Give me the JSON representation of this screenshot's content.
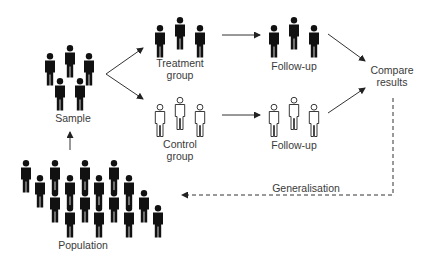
{
  "diagram": {
    "type": "study-design-flow",
    "nodes": {
      "sample": {
        "label": "Sample",
        "figure_count": 5,
        "figure_style": "filled"
      },
      "treatment": {
        "label_line1": "Treatment",
        "label_line2": "group",
        "figure_count": 3,
        "figure_style": "filled"
      },
      "control": {
        "label_line1": "Control",
        "label_line2": "group",
        "figure_count": 3,
        "figure_style": "outline"
      },
      "followup_treatment": {
        "label": "Follow-up",
        "figure_count": 3,
        "figure_style": "filled"
      },
      "followup_control": {
        "label": "Follow-up",
        "figure_count": 3,
        "figure_style": "outline"
      },
      "compare": {
        "label_line1": "Compare",
        "label_line2": "results"
      },
      "population": {
        "label": "Population",
        "figure_count": 20,
        "figure_style": "filled"
      }
    },
    "edges": [
      {
        "from": "population",
        "to": "sample",
        "style": "solid"
      },
      {
        "from": "sample",
        "to": "treatment",
        "style": "solid"
      },
      {
        "from": "sample",
        "to": "control",
        "style": "solid"
      },
      {
        "from": "treatment",
        "to": "followup_treatment",
        "style": "solid"
      },
      {
        "from": "control",
        "to": "followup_control",
        "style": "solid"
      },
      {
        "from": "followup_treatment",
        "to": "compare",
        "style": "solid"
      },
      {
        "from": "followup_control",
        "to": "compare",
        "style": "solid"
      },
      {
        "from": "compare",
        "to": "population",
        "style": "dashed",
        "label": "Generalisation"
      }
    ],
    "generalisation_label": "Generalisation"
  },
  "colors": {
    "figure_fill": "#111111",
    "figure_outline": "#222222",
    "arrow": "#333333",
    "text": "#3a3a3a",
    "background": "#ffffff"
  }
}
